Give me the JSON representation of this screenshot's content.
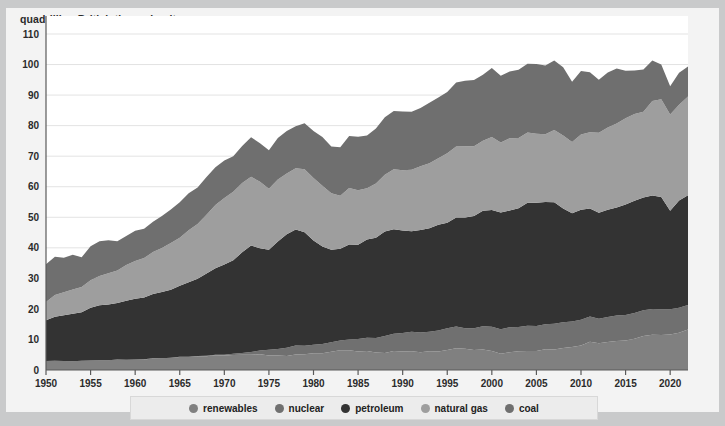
{
  "header": {
    "axis_title": "quadrillion British thermal units"
  },
  "legend": {
    "items": [
      {
        "label": "renewables",
        "color": "#808080"
      },
      {
        "label": "nuclear",
        "color": "#707070"
      },
      {
        "label": "petroleum",
        "color": "#333333"
      },
      {
        "label": "natural gas",
        "color": "#9e9e9e"
      },
      {
        "label": "coal",
        "color": "#6f6f6f"
      }
    ]
  },
  "chart_data": {
    "type": "area",
    "title": "",
    "subtitle": "",
    "xlabel": "",
    "ylabel": "quadrillion British thermal units",
    "stacked": true,
    "grid": true,
    "legend_position": "bottom",
    "xlim": [
      1950,
      2022
    ],
    "ylim": [
      0,
      110
    ],
    "ytick_step": 10,
    "yticks": [
      0,
      10,
      20,
      30,
      40,
      50,
      60,
      70,
      80,
      90,
      100,
      110
    ],
    "xticks": [
      1950,
      1955,
      1960,
      1965,
      1970,
      1975,
      1980,
      1985,
      1990,
      1995,
      2000,
      2005,
      2010,
      2015,
      2020
    ],
    "x": [
      1950,
      1951,
      1952,
      1953,
      1954,
      1955,
      1956,
      1957,
      1958,
      1959,
      1960,
      1961,
      1962,
      1963,
      1964,
      1965,
      1966,
      1967,
      1968,
      1969,
      1970,
      1971,
      1972,
      1973,
      1974,
      1975,
      1976,
      1977,
      1978,
      1979,
      1980,
      1981,
      1982,
      1983,
      1984,
      1985,
      1986,
      1987,
      1988,
      1989,
      1990,
      1991,
      1992,
      1993,
      1994,
      1995,
      1996,
      1997,
      1998,
      1999,
      2000,
      2001,
      2002,
      2003,
      2004,
      2005,
      2006,
      2007,
      2008,
      2009,
      2010,
      2011,
      2012,
      2013,
      2014,
      2015,
      2016,
      2017,
      2018,
      2019,
      2020,
      2021,
      2022
    ],
    "series": [
      {
        "name": "renewables",
        "color": "#808080",
        "values": [
          2.98,
          3.04,
          2.94,
          2.89,
          3.03,
          3.09,
          3.16,
          3.18,
          3.42,
          3.32,
          3.4,
          3.47,
          3.8,
          3.83,
          3.97,
          4.27,
          4.28,
          4.5,
          4.51,
          4.84,
          4.77,
          4.95,
          5.01,
          4.97,
          5.15,
          4.73,
          4.77,
          4.61,
          5.04,
          5.17,
          5.49,
          5.48,
          5.98,
          6.45,
          6.46,
          6.03,
          6.18,
          5.69,
          5.56,
          6.24,
          6.04,
          6.13,
          5.83,
          6.15,
          6.07,
          6.56,
          7.11,
          6.95,
          6.56,
          6.7,
          6.26,
          5.33,
          5.84,
          6.15,
          6.26,
          6.23,
          6.79,
          6.68,
          7.18,
          7.53,
          8.06,
          9.22,
          8.73,
          9.15,
          9.48,
          9.66,
          10.23,
          11.13,
          11.53,
          11.46,
          11.66,
          12.22,
          13.24
        ]
      },
      {
        "name": "nuclear",
        "color": "#707070",
        "values": [
          0,
          0,
          0,
          0,
          0,
          0,
          0,
          0,
          0,
          0,
          0.01,
          0.02,
          0.03,
          0.04,
          0.04,
          0.04,
          0.06,
          0.09,
          0.14,
          0.15,
          0.24,
          0.41,
          0.58,
          0.91,
          1.27,
          1.9,
          2.11,
          2.7,
          3.02,
          2.78,
          2.74,
          3.01,
          3.13,
          3.2,
          3.55,
          4.08,
          4.38,
          4.75,
          5.59,
          5.6,
          6.1,
          6.42,
          6.48,
          6.41,
          6.84,
          7.08,
          7.17,
          6.68,
          7.07,
          7.61,
          7.86,
          8.03,
          8.14,
          7.96,
          8.22,
          8.16,
          8.21,
          8.46,
          8.43,
          8.35,
          8.43,
          8.26,
          8.06,
          8.24,
          8.34,
          8.34,
          8.43,
          8.42,
          8.44,
          8.46,
          8.25,
          8.13,
          8.05
        ]
      },
      {
        "name": "petroleum",
        "color": "#333333",
        "values": [
          13.32,
          14.43,
          14.96,
          15.56,
          15.84,
          17.26,
          18.03,
          18.3,
          18.53,
          19.32,
          19.92,
          20.22,
          21.05,
          21.7,
          22.3,
          23.25,
          24.4,
          25.28,
          26.98,
          28.34,
          29.52,
          30.56,
          32.95,
          34.84,
          33.46,
          32.73,
          35.17,
          37.12,
          37.97,
          37.12,
          34.2,
          31.93,
          30.23,
          30.05,
          31.05,
          30.92,
          32.2,
          32.87,
          34.22,
          34.21,
          33.55,
          32.85,
          33.53,
          33.84,
          34.67,
          34.55,
          35.67,
          36.27,
          36.82,
          37.82,
          38.26,
          38.19,
          38.23,
          38.81,
          40.29,
          40.39,
          39.96,
          39.77,
          37.28,
          35.4,
          36.0,
          35.36,
          34.7,
          35.11,
          35.42,
          36.15,
          36.72,
          36.95,
          37.13,
          36.68,
          32.23,
          35.11,
          35.94
        ]
      },
      {
        "name": "natural gas",
        "color": "#9e9e9e",
        "values": [
          5.97,
          7.05,
          7.55,
          7.91,
          8.33,
          9.0,
          9.61,
          10.19,
          10.66,
          11.72,
          12.39,
          12.93,
          13.73,
          14.4,
          15.29,
          15.77,
          16.99,
          17.94,
          19.21,
          20.68,
          21.79,
          22.47,
          22.7,
          22.51,
          21.73,
          19.95,
          20.35,
          19.93,
          20.0,
          20.67,
          20.39,
          19.93,
          18.5,
          17.36,
          18.51,
          17.83,
          16.71,
          17.74,
          18.55,
          19.71,
          19.73,
          20.13,
          20.83,
          21.28,
          21.73,
          22.77,
          23.2,
          23.32,
          22.83,
          22.91,
          23.92,
          22.9,
          23.63,
          23.07,
          23.0,
          22.58,
          22.24,
          23.65,
          23.84,
          23.39,
          24.58,
          25.0,
          26.16,
          26.85,
          27.43,
          28.25,
          28.43,
          28.03,
          31.0,
          32.05,
          31.54,
          31.34,
          32.31
        ]
      },
      {
        "name": "coal",
        "color": "#6f6f6f",
        "values": [
          12.35,
          12.55,
          11.31,
          11.37,
          9.71,
          11.17,
          11.35,
          10.82,
          9.53,
          9.52,
          9.84,
          9.62,
          9.91,
          10.41,
          10.96,
          11.58,
          12.14,
          11.93,
          12.33,
          12.38,
          12.26,
          11.6,
          12.08,
          12.97,
          12.66,
          12.66,
          13.58,
          13.92,
          13.77,
          15.04,
          15.42,
          15.91,
          15.32,
          15.89,
          17.07,
          17.48,
          17.26,
          18.01,
          18.85,
          19.07,
          19.17,
          18.99,
          19.12,
          19.84,
          19.91,
          20.09,
          21.0,
          21.45,
          21.66,
          21.62,
          22.58,
          21.91,
          21.9,
          22.32,
          22.47,
          22.8,
          22.45,
          22.75,
          22.39,
          19.69,
          20.83,
          19.64,
          17.34,
          18.04,
          18.0,
          15.55,
          14.23,
          13.85,
          13.25,
          11.34,
          9.2,
          10.55,
          9.85
        ]
      }
    ]
  }
}
